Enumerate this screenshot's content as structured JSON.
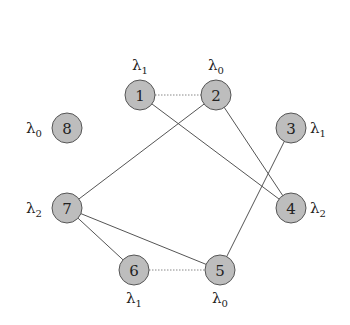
{
  "diagram": {
    "type": "graph",
    "colors": {
      "node_fill": "#bdbdbd",
      "node_stroke": "#555555",
      "edge": "#555555",
      "background": "#ffffff"
    },
    "nodes": [
      {
        "id": "1",
        "label": "1",
        "x": 140,
        "y": 95,
        "lambda": "λ",
        "lambda_sub": "1",
        "label_pos": "above"
      },
      {
        "id": "2",
        "label": "2",
        "x": 216,
        "y": 95,
        "lambda": "λ",
        "lambda_sub": "0",
        "label_pos": "above"
      },
      {
        "id": "3",
        "label": "3",
        "x": 291,
        "y": 128,
        "lambda": "λ",
        "lambda_sub": "1",
        "label_pos": "right"
      },
      {
        "id": "4",
        "label": "4",
        "x": 291,
        "y": 208,
        "lambda": "λ",
        "lambda_sub": "2",
        "label_pos": "right"
      },
      {
        "id": "5",
        "label": "5",
        "x": 220,
        "y": 270,
        "lambda": "λ",
        "lambda_sub": "0",
        "label_pos": "below"
      },
      {
        "id": "6",
        "label": "6",
        "x": 134,
        "y": 270,
        "lambda": "λ",
        "lambda_sub": "1",
        "label_pos": "below"
      },
      {
        "id": "7",
        "label": "7",
        "x": 67,
        "y": 208,
        "lambda": "λ",
        "lambda_sub": "2",
        "label_pos": "left"
      },
      {
        "id": "8",
        "label": "8",
        "x": 67,
        "y": 128,
        "lambda": "λ",
        "lambda_sub": "0",
        "label_pos": "left"
      }
    ],
    "edges": [
      {
        "from": "1",
        "to": "2",
        "style": "dotted"
      },
      {
        "from": "1",
        "to": "4",
        "style": "solid"
      },
      {
        "from": "2",
        "to": "7",
        "style": "solid"
      },
      {
        "from": "2",
        "to": "4",
        "style": "solid"
      },
      {
        "from": "3",
        "to": "5",
        "style": "solid"
      },
      {
        "from": "7",
        "to": "6",
        "style": "solid"
      },
      {
        "from": "7",
        "to": "5",
        "style": "solid"
      },
      {
        "from": "6",
        "to": "5",
        "style": "dotted"
      }
    ]
  }
}
